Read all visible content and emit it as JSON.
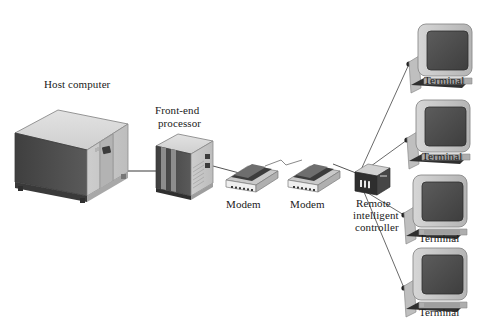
{
  "diagram": {
    "background": "#ffffff",
    "palette": {
      "top_face": "#d8d8d8",
      "front_face": "#c9c9c9",
      "side_dark": "#4a4a4a",
      "screen_dark": "#4f4f4f",
      "outline": "#2b2b2b",
      "line": "#555555",
      "label_color": "#1a1a1a"
    },
    "nodes": [
      {
        "id": "host",
        "label": "Host computer",
        "type": "mainframe"
      },
      {
        "id": "fep",
        "label": "Front-end\nprocessor",
        "label_line1": "Front-end",
        "label_line2": "processor",
        "type": "processor"
      },
      {
        "id": "modem1",
        "label": "Modem",
        "type": "modem"
      },
      {
        "id": "modem2",
        "label": "Modem",
        "type": "modem"
      },
      {
        "id": "controller",
        "label": "Remote\nintelligent\ncontroller",
        "label_line1": "Remote",
        "label_line2": "intelligent",
        "label_line3": "controller",
        "type": "controller"
      },
      {
        "id": "terminal1",
        "label": "Terminal",
        "type": "terminal"
      },
      {
        "id": "terminal2",
        "label": "Terminal",
        "type": "terminal"
      },
      {
        "id": "terminal3",
        "label": "Terminal",
        "type": "terminal"
      },
      {
        "id": "terminal4",
        "label": "Terminal",
        "type": "terminal"
      }
    ],
    "links": [
      {
        "from": "host",
        "to": "fep",
        "style": "solid"
      },
      {
        "from": "fep",
        "to": "modem1",
        "style": "solid"
      },
      {
        "from": "modem1",
        "to": "modem2",
        "style": "telephone-line"
      },
      {
        "from": "modem2",
        "to": "controller",
        "style": "solid"
      },
      {
        "from": "controller",
        "to": "terminal1",
        "style": "solid"
      },
      {
        "from": "controller",
        "to": "terminal2",
        "style": "solid"
      },
      {
        "from": "controller",
        "to": "terminal3",
        "style": "solid"
      },
      {
        "from": "controller",
        "to": "terminal4",
        "style": "solid"
      }
    ]
  }
}
